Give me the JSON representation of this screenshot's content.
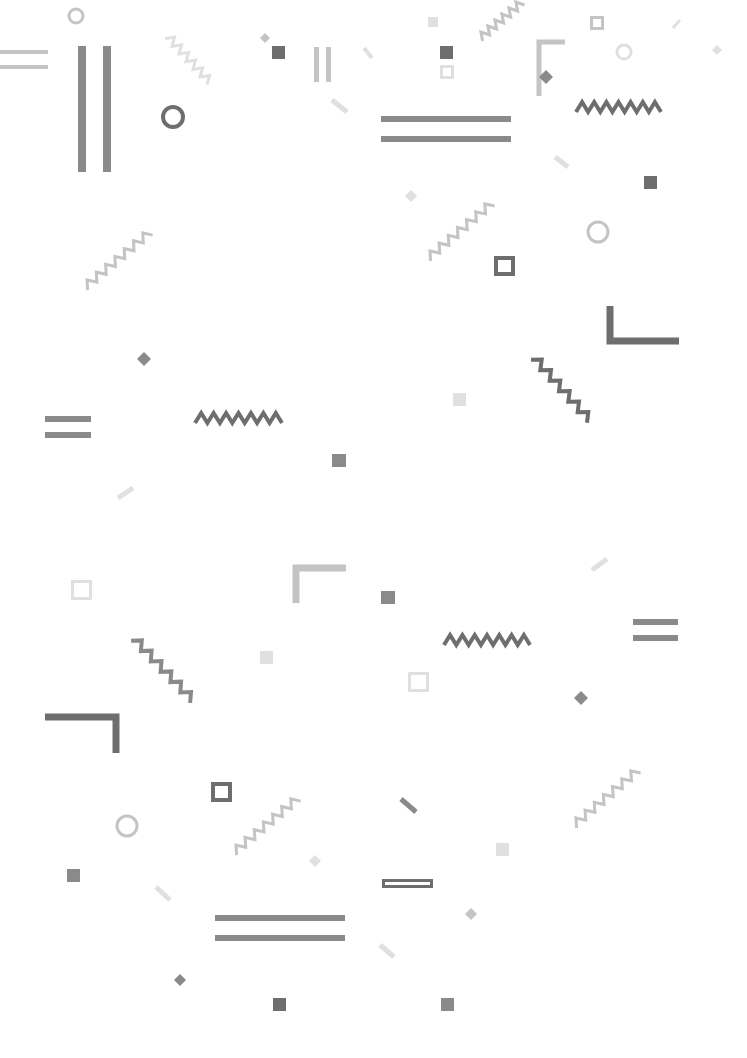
{
  "canvas": {
    "width": 747,
    "height": 1058,
    "background": "#ffffff"
  },
  "colors": {
    "dark": "#6e6e6e",
    "mid": "#8a8a8a",
    "light": "#c4c4c4",
    "faint": "#e0e0e0"
  },
  "shapes": [
    {
      "type": "circle",
      "cx": 76,
      "cy": 16,
      "r": 7,
      "stroke": "light",
      "sw": 3
    },
    {
      "type": "hlines",
      "x": 0,
      "y": 50,
      "w": 48,
      "gap": 15,
      "h": 4,
      "fill": "light"
    },
    {
      "type": "vlines",
      "x": 78,
      "y": 46,
      "h": 126,
      "gap": 25,
      "w": 8,
      "fill": "mid"
    },
    {
      "type": "circle",
      "cx": 173,
      "cy": 117,
      "r": 10,
      "stroke": "dark",
      "sw": 4
    },
    {
      "type": "zigzag",
      "x1": 168,
      "y1": 36,
      "x2": 210,
      "y2": 82,
      "amp": 4,
      "n": 6,
      "stroke": "faint",
      "sw": 3
    },
    {
      "type": "diamond",
      "cx": 265,
      "cy": 38,
      "s": 10,
      "fill": "light"
    },
    {
      "type": "rect",
      "x": 272,
      "y": 46,
      "w": 13,
      "h": 13,
      "fill": "dark"
    },
    {
      "type": "vlines",
      "x": 314,
      "y": 47,
      "h": 35,
      "gap": 12,
      "w": 5,
      "fill": "light"
    },
    {
      "type": "slash",
      "x1": 364,
      "y1": 48,
      "x2": 372,
      "y2": 58,
      "sw": 4,
      "stroke": "faint"
    },
    {
      "type": "slash",
      "x1": 332,
      "y1": 100,
      "x2": 347,
      "y2": 112,
      "sw": 5,
      "stroke": "faint"
    },
    {
      "type": "rect",
      "x": 428,
      "y": 17,
      "w": 10,
      "h": 10,
      "fill": "faint"
    },
    {
      "type": "rect",
      "x": 440,
      "y": 46,
      "w": 13,
      "h": 13,
      "fill": "dark"
    },
    {
      "type": "rectOutline",
      "x": 440,
      "y": 65,
      "w": 14,
      "h": 14,
      "stroke": "faint",
      "sw": 3
    },
    {
      "type": "hlines",
      "x": 381,
      "y": 116,
      "w": 130,
      "gap": 20,
      "h": 6,
      "fill": "mid"
    },
    {
      "type": "zigzag",
      "x1": 480,
      "y1": 38,
      "x2": 522,
      "y2": 2,
      "amp": 4,
      "n": 6,
      "stroke": "light",
      "sw": 3
    },
    {
      "type": "corner",
      "x": 539,
      "y": 42,
      "w": 26,
      "h": 54,
      "sw": 5,
      "orient": "tl",
      "stroke": "light"
    },
    {
      "type": "diamond",
      "cx": 546,
      "cy": 77,
      "s": 14,
      "fill": "mid"
    },
    {
      "type": "rectOutline",
      "x": 590,
      "y": 16,
      "w": 14,
      "h": 14,
      "stroke": "light",
      "sw": 3
    },
    {
      "type": "circle",
      "cx": 624,
      "cy": 52,
      "r": 7,
      "stroke": "faint",
      "sw": 3
    },
    {
      "type": "slash",
      "x1": 673,
      "y1": 28,
      "x2": 680,
      "y2": 20,
      "sw": 3,
      "stroke": "faint"
    },
    {
      "type": "diamond",
      "cx": 717,
      "cy": 50,
      "s": 10,
      "fill": "faint"
    },
    {
      "type": "zigzag",
      "x1": 576,
      "y1": 107,
      "x2": 661,
      "y2": 107,
      "amp": 5,
      "n": 7,
      "stroke": "dark",
      "sw": 4,
      "horizontal": true
    },
    {
      "type": "slash",
      "x1": 555,
      "y1": 157,
      "x2": 568,
      "y2": 167,
      "sw": 5,
      "stroke": "faint"
    },
    {
      "type": "rect",
      "x": 644,
      "y": 176,
      "w": 13,
      "h": 13,
      "fill": "dark"
    },
    {
      "type": "diamond",
      "cx": 411,
      "cy": 196,
      "s": 12,
      "fill": "faint"
    },
    {
      "type": "zigzag",
      "x1": 428,
      "y1": 258,
      "x2": 492,
      "y2": 203,
      "amp": 4,
      "n": 7,
      "stroke": "light",
      "sw": 3
    },
    {
      "type": "circle",
      "cx": 598,
      "cy": 232,
      "r": 10,
      "stroke": "light",
      "sw": 3
    },
    {
      "type": "rectOutline",
      "x": 494,
      "y": 256,
      "w": 21,
      "h": 20,
      "stroke": "dark",
      "sw": 4
    },
    {
      "type": "corner",
      "x": 610,
      "y": 306,
      "w": 69,
      "h": 35,
      "sw": 7,
      "orient": "bl",
      "stroke": "dark"
    },
    {
      "type": "zigzag",
      "x1": 85,
      "y1": 287,
      "x2": 150,
      "y2": 232,
      "amp": 4,
      "n": 7,
      "stroke": "light",
      "sw": 3
    },
    {
      "type": "diamond",
      "cx": 144,
      "cy": 359,
      "s": 14,
      "fill": "mid"
    },
    {
      "type": "hlines",
      "x": 45,
      "y": 416,
      "w": 46,
      "gap": 16,
      "h": 6,
      "fill": "mid"
    },
    {
      "type": "zigzag",
      "x1": 195,
      "y1": 418,
      "x2": 282,
      "y2": 418,
      "amp": 5,
      "n": 7,
      "stroke": "dark",
      "sw": 4,
      "horizontal": true
    },
    {
      "type": "rect",
      "x": 332,
      "y": 454,
      "w": 14,
      "h": 13,
      "fill": "mid"
    },
    {
      "type": "slash",
      "x1": 118,
      "y1": 498,
      "x2": 133,
      "y2": 488,
      "sw": 5,
      "stroke": "faint"
    },
    {
      "type": "rect",
      "x": 453,
      "y": 393,
      "w": 13,
      "h": 13,
      "fill": "faint"
    },
    {
      "type": "zigzag",
      "x1": 534,
      "y1": 357,
      "x2": 590,
      "y2": 420,
      "amp": 4,
      "n": 6,
      "stroke": "dark",
      "sw": 4
    },
    {
      "type": "slash",
      "x1": 592,
      "y1": 570,
      "x2": 607,
      "y2": 559,
      "sw": 5,
      "stroke": "faint"
    },
    {
      "type": "rectOutline",
      "x": 71,
      "y": 580,
      "w": 21,
      "h": 20,
      "stroke": "faint",
      "sw": 3
    },
    {
      "type": "corner",
      "x": 296,
      "y": 568,
      "w": 50,
      "h": 35,
      "sw": 7,
      "orient": "tl",
      "stroke": "light"
    },
    {
      "type": "rect",
      "x": 381,
      "y": 591,
      "w": 14,
      "h": 13,
      "fill": "mid"
    },
    {
      "type": "zigzag",
      "x1": 134,
      "y1": 638,
      "x2": 193,
      "y2": 700,
      "amp": 4,
      "n": 6,
      "stroke": "mid",
      "sw": 4
    },
    {
      "type": "rect",
      "x": 260,
      "y": 651,
      "w": 13,
      "h": 13,
      "fill": "faint"
    },
    {
      "type": "zigzag",
      "x1": 444,
      "y1": 640,
      "x2": 530,
      "y2": 640,
      "amp": 5,
      "n": 7,
      "stroke": "dark",
      "sw": 4,
      "horizontal": true
    },
    {
      "type": "hlines",
      "x": 633,
      "y": 619,
      "w": 45,
      "gap": 16,
      "h": 6,
      "fill": "mid"
    },
    {
      "type": "rectOutline",
      "x": 408,
      "y": 672,
      "w": 21,
      "h": 20,
      "stroke": "faint",
      "sw": 3
    },
    {
      "type": "diamond",
      "cx": 581,
      "cy": 698,
      "s": 14,
      "fill": "mid"
    },
    {
      "type": "corner",
      "x": 45,
      "y": 717,
      "w": 71,
      "h": 36,
      "sw": 7,
      "orient": "tr",
      "stroke": "dark"
    },
    {
      "type": "rectOutline",
      "x": 211,
      "y": 782,
      "w": 21,
      "h": 20,
      "stroke": "dark",
      "sw": 4
    },
    {
      "type": "circle",
      "cx": 127,
      "cy": 826,
      "r": 10,
      "stroke": "light",
      "sw": 3
    },
    {
      "type": "zigzag",
      "x1": 234,
      "y1": 852,
      "x2": 298,
      "y2": 798,
      "amp": 4,
      "n": 7,
      "stroke": "light",
      "sw": 3
    },
    {
      "type": "slash",
      "x1": 401,
      "y1": 799,
      "x2": 416,
      "y2": 812,
      "sw": 5,
      "stroke": "mid"
    },
    {
      "type": "zigzag",
      "x1": 574,
      "y1": 825,
      "x2": 638,
      "y2": 770,
      "amp": 4,
      "n": 7,
      "stroke": "light",
      "sw": 3
    },
    {
      "type": "rect",
      "x": 67,
      "y": 869,
      "w": 13,
      "h": 13,
      "fill": "mid"
    },
    {
      "type": "diamond",
      "cx": 315,
      "cy": 861,
      "s": 12,
      "fill": "faint"
    },
    {
      "type": "rect",
      "x": 496,
      "y": 843,
      "w": 13,
      "h": 13,
      "fill": "faint"
    },
    {
      "type": "slash",
      "x1": 156,
      "y1": 887,
      "x2": 170,
      "y2": 900,
      "sw": 5,
      "stroke": "faint"
    },
    {
      "type": "rectOutline",
      "x": 382,
      "y": 879,
      "w": 51,
      "h": 9,
      "stroke": "dark",
      "sw": 3
    },
    {
      "type": "diamond",
      "cx": 471,
      "cy": 914,
      "s": 12,
      "fill": "light"
    },
    {
      "type": "hlines",
      "x": 215,
      "y": 915,
      "w": 130,
      "gap": 20,
      "h": 6,
      "fill": "mid"
    },
    {
      "type": "slash",
      "x1": 380,
      "y1": 945,
      "x2": 394,
      "y2": 957,
      "sw": 5,
      "stroke": "faint"
    },
    {
      "type": "diamond",
      "cx": 180,
      "cy": 980,
      "s": 12,
      "fill": "mid"
    },
    {
      "type": "rect",
      "x": 273,
      "y": 998,
      "w": 13,
      "h": 13,
      "fill": "dark"
    },
    {
      "type": "rect",
      "x": 441,
      "y": 998,
      "w": 13,
      "h": 13,
      "fill": "mid"
    }
  ]
}
